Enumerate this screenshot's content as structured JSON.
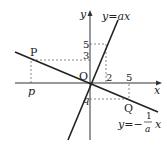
{
  "diagram": {
    "axes": {
      "x_label": "x",
      "y_label": "y",
      "origin_label": "O"
    },
    "lines": [
      {
        "name": "steep",
        "label": "y=ax"
      },
      {
        "name": "shallow",
        "label_prefix": "y=−",
        "frac_num": "1",
        "frac_den": "a",
        "label_suffix": "x"
      }
    ],
    "points": [
      {
        "name": "P",
        "label": "P",
        "x_label": "p",
        "y_label": "3"
      },
      {
        "name": "Q",
        "label": "Q",
        "x_label": "5",
        "y_label": "q"
      }
    ],
    "ticks": {
      "x2": "2",
      "y5": "5",
      "y3": "3",
      "x5": "5"
    }
  }
}
